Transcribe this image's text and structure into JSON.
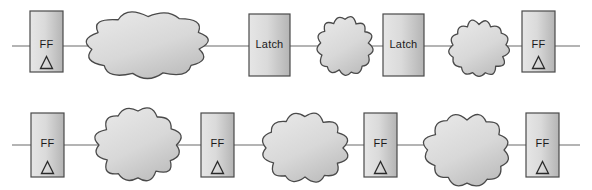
{
  "diagram": {
    "type": "circuit-block-diagram",
    "colors": {
      "background": "#ffffff",
      "box_fill_light": "#e2e2e2",
      "box_fill_dark": "#b8b8b8",
      "cloud_fill_light": "#e4e4e4",
      "cloud_fill_dark": "#c2c2c2",
      "stroke": "#4a4a4a",
      "wire": "#6a6a6a",
      "text": "#1a1a1a"
    },
    "labels": {
      "ff": "FF",
      "latch": "Latch",
      "clock_glyph": "triangle"
    },
    "rows": [
      {
        "name": "row-1-ff-latch-latch-ff",
        "y_center": 46,
        "wire": {
          "x_start": 12,
          "x_end": 580
        },
        "elements": [
          {
            "kind": "box",
            "name": "ff-1",
            "label": "FF",
            "clock": true,
            "x": 30,
            "y": 11,
            "w": 33,
            "h": 61
          },
          {
            "kind": "cloud",
            "name": "cloud-1",
            "size": "large",
            "cx": 148,
            "cy": 45,
            "rx": 55,
            "ry": 30
          },
          {
            "kind": "box",
            "name": "latch-1",
            "label": "Latch",
            "clock": false,
            "x": 249,
            "y": 14,
            "w": 41,
            "h": 62
          },
          {
            "kind": "cloud",
            "name": "cloud-2",
            "size": "small",
            "cx": 345,
            "cy": 46,
            "rx": 25,
            "ry": 26
          },
          {
            "kind": "box",
            "name": "latch-2",
            "label": "Latch",
            "clock": false,
            "x": 383,
            "y": 14,
            "w": 41,
            "h": 62
          },
          {
            "kind": "cloud",
            "name": "cloud-3",
            "size": "small",
            "cx": 479,
            "cy": 48,
            "rx": 26,
            "ry": 25
          },
          {
            "kind": "box",
            "name": "ff-2",
            "label": "FF",
            "clock": true,
            "x": 522,
            "y": 11,
            "w": 33,
            "h": 61
          }
        ]
      },
      {
        "name": "row-2-ff-ff-ff-ff",
        "y_center": 145,
        "wire": {
          "x_start": 12,
          "x_end": 580
        },
        "elements": [
          {
            "kind": "box",
            "name": "ff-3",
            "label": "FF",
            "clock": true,
            "x": 31,
            "y": 113,
            "w": 33,
            "h": 64
          },
          {
            "kind": "cloud",
            "name": "cloud-4",
            "size": "medium",
            "cx": 138,
            "cy": 145,
            "rx": 38,
            "ry": 32
          },
          {
            "kind": "box",
            "name": "ff-4",
            "label": "FF",
            "clock": true,
            "x": 201,
            "y": 113,
            "w": 33,
            "h": 64
          },
          {
            "kind": "cloud",
            "name": "cloud-5",
            "size": "medium",
            "cx": 305,
            "cy": 148,
            "rx": 38,
            "ry": 31
          },
          {
            "kind": "box",
            "name": "ff-5",
            "label": "FF",
            "clock": true,
            "x": 364,
            "y": 113,
            "w": 33,
            "h": 64
          },
          {
            "kind": "cloud",
            "name": "cloud-6",
            "size": "medium",
            "cx": 467,
            "cy": 150,
            "rx": 38,
            "ry": 32
          },
          {
            "kind": "box",
            "name": "ff-6",
            "label": "FF",
            "clock": true,
            "x": 526,
            "y": 113,
            "w": 33,
            "h": 64
          }
        ]
      }
    ]
  }
}
